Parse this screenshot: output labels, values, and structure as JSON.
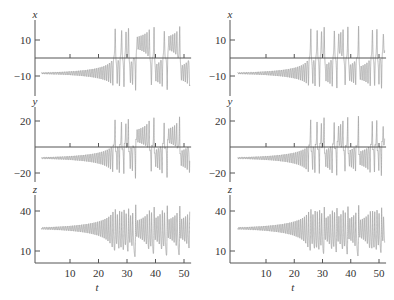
{
  "chart_data": [
    {
      "type": "line",
      "title": "",
      "description": "Lorenz system time series, left column (initial condition A)",
      "panels": [
        {
          "variable": "x",
          "ylabel": "x",
          "yticks": [
            10,
            -10
          ],
          "ytick_labels": [
            "10",
            "−10"
          ],
          "ylim": [
            -19,
            19
          ],
          "zero_line": true,
          "pattern": "starts near x≈-7 with growing oscillations until t≈16, then switches erratically; growing positive oscillations t≈19-27; chaotic switching afterwards"
        },
        {
          "variable": "y",
          "ylabel": "y",
          "yticks": [
            20,
            -20
          ],
          "ytick_labels": [
            "20",
            "−20"
          ],
          "ylim": [
            -27,
            27
          ],
          "zero_line": true,
          "pattern": "similar to x but larger amplitude"
        },
        {
          "variable": "z",
          "ylabel": "z",
          "yticks": [
            40,
            10
          ],
          "ytick_labels": [
            "40",
            "10"
          ],
          "ylim": [
            1,
            48
          ],
          "zero_line": false,
          "pattern": "oscillates around z≈27 with growing amplitude, bursts near t≈18, 36, 46"
        }
      ],
      "xlabel": "t",
      "xticks": [
        10,
        20,
        30,
        40,
        50
      ],
      "xlim": [
        0,
        52
      ]
    },
    {
      "type": "line",
      "title": "",
      "description": "Lorenz system time series, right column (slightly perturbed initial condition B)",
      "panels": [
        {
          "variable": "x",
          "ylabel": "x",
          "yticks": [
            10,
            -10
          ],
          "ytick_labels": [
            "10",
            "−10"
          ],
          "ylim": [
            -19,
            19
          ],
          "zero_line": true
        },
        {
          "variable": "y",
          "ylabel": "y",
          "yticks": [
            20,
            -20
          ],
          "ytick_labels": [
            "20",
            "−20"
          ],
          "ylim": [
            -27,
            27
          ],
          "zero_line": true
        },
        {
          "variable": "z",
          "ylabel": "z",
          "yticks": [
            40,
            10
          ],
          "ytick_labels": [
            "40",
            "10"
          ],
          "ylim": [
            1,
            48
          ],
          "zero_line": false
        }
      ],
      "xlabel": "t",
      "xticks": [
        10,
        20,
        30,
        40,
        50
      ],
      "xlim": [
        0,
        52
      ]
    }
  ],
  "labels": {
    "x": "x",
    "y": "y",
    "z": "z",
    "t": "t",
    "x_pos": "10",
    "x_neg": "−10",
    "y_pos": "20",
    "y_neg": "−20",
    "z_hi": "40",
    "z_lo": "10",
    "tick10": "10",
    "tick20": "20",
    "tick30": "30",
    "tick40": "40",
    "tick50": "50"
  },
  "colors": {
    "trace": "#9a9a9a",
    "axis": "#555555"
  }
}
